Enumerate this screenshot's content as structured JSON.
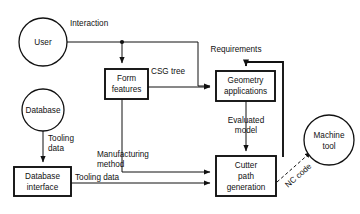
{
  "diagram": {
    "background_color": "#ffffff",
    "line_color": "#111111",
    "nodes": [
      {
        "id": "user",
        "shape": "circle",
        "label": "User",
        "lines": [
          "User"
        ]
      },
      {
        "id": "database",
        "shape": "circle",
        "label": "Database",
        "lines": [
          "Database"
        ]
      },
      {
        "id": "dbinterface",
        "shape": "box",
        "label": "Database interface",
        "lines": [
          "Database",
          "interface"
        ]
      },
      {
        "id": "formfeat",
        "shape": "box",
        "label": "Form features",
        "lines": [
          "Form",
          "features"
        ]
      },
      {
        "id": "geomapp",
        "shape": "box",
        "label": "Geometry applications",
        "lines": [
          "Geometry",
          "applications"
        ]
      },
      {
        "id": "cutterpath",
        "shape": "box",
        "label": "Cutter path generation",
        "lines": [
          "Cutter",
          "path",
          "generation"
        ]
      },
      {
        "id": "machinetool",
        "shape": "circle",
        "label": "Machine tool",
        "lines": [
          "Machine",
          "tool"
        ]
      }
    ],
    "edges": [
      {
        "id": "interaction",
        "label": "Interaction",
        "from": "user",
        "to": "geomapp",
        "style": "solid"
      },
      {
        "id": "user-form",
        "label": "",
        "from": "user",
        "to": "formfeat",
        "style": "solid"
      },
      {
        "id": "csgtree",
        "label": "CSG tree",
        "from": "formfeat",
        "to": "geomapp",
        "style": "solid"
      },
      {
        "id": "requirements",
        "label": "Requirements",
        "from": "cutterpath",
        "to": "geomapp",
        "style": "solid"
      },
      {
        "id": "evaluated",
        "label": "Evaluated model",
        "from": "geomapp",
        "to": "cutterpath",
        "style": "solid"
      },
      {
        "id": "tooling-data",
        "label": "Tooling data",
        "from": "database",
        "to": "dbinterface",
        "style": "solid"
      },
      {
        "id": "tooling-data-2",
        "label": "Tooling data",
        "from": "dbinterface",
        "to": "cutterpath",
        "style": "solid"
      },
      {
        "id": "manufacturing",
        "label": "Manufacturing method",
        "from": "formfeat",
        "to": "cutterpath",
        "style": "solid"
      },
      {
        "id": "nccode",
        "label": "NC code",
        "from": "cutterpath",
        "to": "machinetool",
        "style": "dashed"
      }
    ],
    "edge_labels": {
      "interaction": "Interaction",
      "csg_tree": "CSG tree",
      "requirements": "Requirements",
      "evaluated_model_l1": "Evaluated",
      "evaluated_model_l2": "model",
      "tooling_data_l1": "Tooling",
      "tooling_data_l2": "data",
      "tooling_data_flat": "Tooling data",
      "manufacturing_l1": "Manufacturing",
      "manufacturing_l2": "method",
      "nc_code": "NC code"
    },
    "node_text": {
      "user": "User",
      "database": "Database",
      "dbinterface_l1": "Database",
      "dbinterface_l2": "interface",
      "formfeat_l1": "Form",
      "formfeat_l2": "features",
      "geomapp_l1": "Geometry",
      "geomapp_l2": "applications",
      "cutterpath_l1": "Cutter",
      "cutterpath_l2": "path",
      "cutterpath_l3": "generation",
      "machinetool_l1": "Machine",
      "machinetool_l2": "tool"
    }
  }
}
